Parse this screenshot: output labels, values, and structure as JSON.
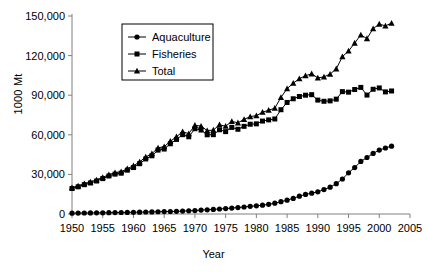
{
  "chart_data": {
    "type": "line",
    "title": "",
    "xlabel": "Year",
    "ylabel": "1000 Mt",
    "xlim": [
      1950,
      2005
    ],
    "ylim": [
      0,
      150000
    ],
    "xticks": [
      1950,
      1955,
      1960,
      1965,
      1970,
      1975,
      1980,
      1985,
      1990,
      1995,
      2000,
      2005
    ],
    "yticks": [
      0,
      30000,
      60000,
      90000,
      120000,
      150000
    ],
    "ytick_labels": [
      "0",
      "30,000",
      "60,000",
      "90,000",
      "120,000",
      "150,000"
    ],
    "xtick_labels": [
      "1950",
      "1955",
      "1960",
      "1965",
      "1970",
      "1975",
      "1980",
      "1985",
      "1990",
      "1995",
      "2000",
      "2005"
    ],
    "grid": false,
    "legend_position": "upper-left-inside",
    "x": [
      1950,
      1951,
      1952,
      1953,
      1954,
      1955,
      1956,
      1957,
      1958,
      1959,
      1960,
      1961,
      1962,
      1963,
      1964,
      1965,
      1966,
      1967,
      1968,
      1969,
      1970,
      1971,
      1972,
      1973,
      1974,
      1975,
      1976,
      1977,
      1978,
      1979,
      1980,
      1981,
      1982,
      1983,
      1984,
      1985,
      1986,
      1987,
      1988,
      1989,
      1990,
      1991,
      1992,
      1993,
      1994,
      1995,
      1996,
      1997,
      1998,
      1999,
      2000,
      2001,
      2002
    ],
    "series": [
      {
        "name": "Aquaculture",
        "marker": "circle",
        "color": "#000000",
        "values": [
          640,
          700,
          760,
          800,
          860,
          920,
          980,
          1050,
          1120,
          1200,
          1300,
          1400,
          1500,
          1600,
          1700,
          1800,
          1900,
          2000,
          2200,
          2400,
          2600,
          3000,
          3200,
          3500,
          3800,
          4100,
          4500,
          4900,
          5300,
          5800,
          6200,
          6700,
          7300,
          8200,
          9300,
          10500,
          11800,
          13500,
          14800,
          15800,
          16800,
          18500,
          20300,
          23000,
          26500,
          31200,
          35200,
          39800,
          42800,
          45900,
          48400,
          50000,
          51400
        ]
      },
      {
        "name": "Fisheries",
        "marker": "square",
        "color": "#000000",
        "values": [
          19300,
          20600,
          22200,
          23500,
          25000,
          26800,
          28800,
          30200,
          30900,
          33200,
          35200,
          38100,
          41700,
          44100,
          48400,
          49200,
          53200,
          56500,
          60100,
          58500,
          64600,
          63600,
          60000,
          60100,
          63800,
          62400,
          65600,
          64200,
          66400,
          68000,
          68300,
          70400,
          71300,
          72000,
          79000,
          84500,
          87300,
          89000,
          90000,
          90400,
          86300,
          85400,
          85700,
          87000,
          92700,
          92300,
          94300,
          95900,
          90100,
          94500,
          95500,
          92500,
          93200
        ]
      },
      {
        "name": "Total",
        "marker": "triangle",
        "color": "#000000",
        "values": [
          19940,
          21300,
          22960,
          24300,
          25860,
          27720,
          29780,
          31250,
          32020,
          34400,
          36500,
          39500,
          43200,
          45700,
          50100,
          51000,
          55100,
          58500,
          62300,
          60900,
          67200,
          66600,
          63200,
          63600,
          67600,
          66500,
          70100,
          69100,
          71700,
          73800,
          74500,
          77100,
          78600,
          80200,
          88300,
          95000,
          99100,
          102500,
          104800,
          106200,
          103100,
          103900,
          106000,
          110000,
          119200,
          123500,
          129500,
          135700,
          132900,
          140400,
          143900,
          142500,
          144600
        ]
      }
    ]
  },
  "legend": {
    "items": [
      {
        "label": "Aquaculture",
        "marker": "circle"
      },
      {
        "label": "Fisheries",
        "marker": "square"
      },
      {
        "label": "Total",
        "marker": "triangle"
      }
    ]
  },
  "axes": {
    "y_title": "1000 Mt",
    "x_title": "Year"
  }
}
